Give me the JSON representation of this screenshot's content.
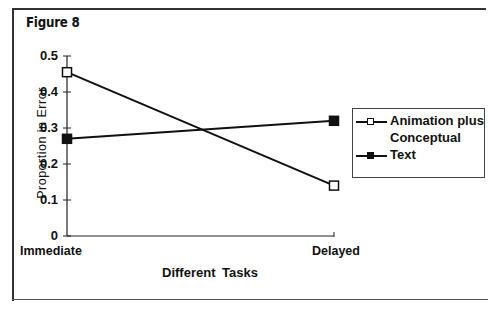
{
  "figure": {
    "title": "Figure 8"
  },
  "chart_data": {
    "type": "line",
    "title": "Figure 8",
    "xlabel": "Different Tasks",
    "ylabel": "Proportion in Error",
    "categories": [
      "Immediate",
      "Delayed"
    ],
    "ylim": [
      0,
      0.5
    ],
    "yticks": [
      "0",
      "0.1",
      "0.2",
      "0.3",
      "0.4",
      "0.5"
    ],
    "grid": false,
    "legend_position": "right",
    "series": [
      {
        "name": "Animation plus Conceptual",
        "marker": "open-square",
        "color": "#111111",
        "values": [
          0.455,
          0.14
        ]
      },
      {
        "name": "Text",
        "marker": "filled-square",
        "color": "#111111",
        "values": [
          0.27,
          0.32
        ]
      }
    ]
  },
  "legend": {
    "items": [
      {
        "label_line1": "Animation plus",
        "label_line2": "Conceptual"
      },
      {
        "label_line1": "Text"
      }
    ]
  }
}
